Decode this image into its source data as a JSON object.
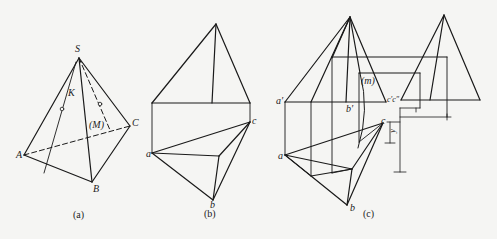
{
  "figure_a": {
    "caption": "(a)",
    "labels": {
      "S": "S",
      "K": "K",
      "M": "(M)",
      "A": "A",
      "B": "B",
      "C": "C"
    }
  },
  "figure_b": {
    "caption": "(b)",
    "labels": {
      "a": "a",
      "b": "b",
      "c": "c"
    }
  },
  "figure_c": {
    "caption": "(c)",
    "labels": {
      "a_prime": "a′",
      "b_prime": "b′",
      "m": "(m)",
      "c_primes": "c′c″",
      "a": "a",
      "b": "b",
      "c": "c",
      "dim": "y"
    }
  }
}
